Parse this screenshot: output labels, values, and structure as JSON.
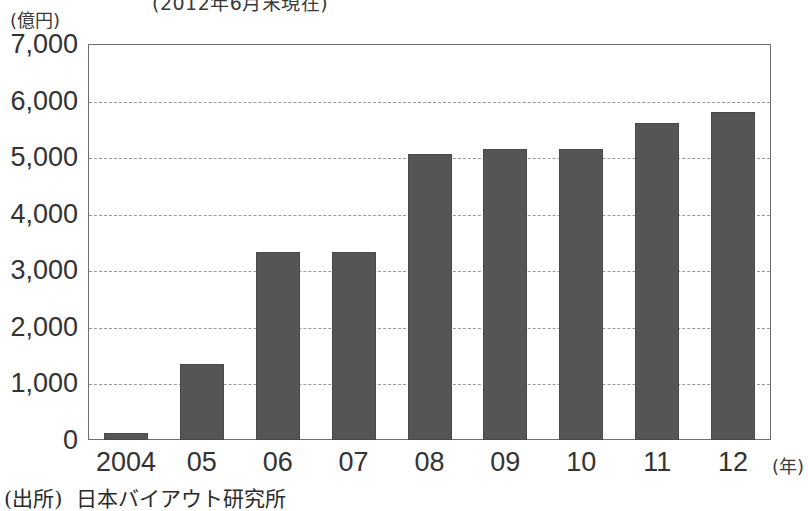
{
  "chart_data": {
    "type": "bar",
    "title": "(2012年6月末現在)",
    "xlabel": "(年)",
    "ylabel": "(億円)",
    "categories": [
      "2004",
      "05",
      "06",
      "07",
      "08",
      "09",
      "10",
      "11",
      "12"
    ],
    "values": [
      130,
      1350,
      3320,
      3320,
      5050,
      5150,
      5150,
      5600,
      5800
    ],
    "ylim": [
      0,
      7000
    ],
    "ytick_labels": [
      "0",
      "1,000",
      "2,000",
      "3,000",
      "4,000",
      "5,000",
      "6,000",
      "7,000"
    ],
    "ytick_values": [
      0,
      1000,
      2000,
      3000,
      4000,
      5000,
      6000,
      7000
    ],
    "grid": true,
    "gridline_style": "dashed",
    "legend": null,
    "bar_color": "#555555",
    "frame_color": "#6e6e6e",
    "gridline_color": "#9a9a9a"
  },
  "source": {
    "label": "(出所)",
    "text": "日本バイアウト研究所"
  }
}
